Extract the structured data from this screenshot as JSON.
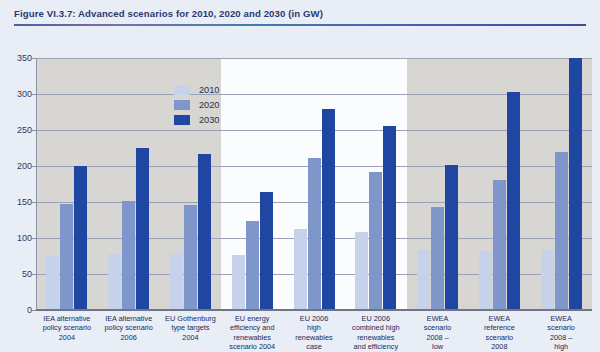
{
  "figure": {
    "title": "Figure VI.3.7: Advanced scenarios for 2010, 2020 and 2030 (in GW)"
  },
  "colors": {
    "s2010": "#c5d2ea",
    "s2020": "#7e96ca",
    "s2030": "#1f46a0",
    "page_background": "#e9edf5",
    "band_grey": "#d8d6d3",
    "band_white": "#fbfcfe",
    "title_text": "#2b3a72"
  },
  "legend": {
    "position": "inside-top-center",
    "entries": [
      {
        "label": "2010",
        "color": "#c5d2ea"
      },
      {
        "label": "2020",
        "color": "#7e96ca"
      },
      {
        "label": "2030",
        "color": "#1f46a0"
      }
    ]
  },
  "yaxis": {
    "ticks": [
      "350",
      "300",
      "250",
      "200",
      "150",
      "100",
      "50",
      "0"
    ],
    "min": 0,
    "max": 350,
    "step": 50
  },
  "chart_data": {
    "type": "bar",
    "title": "Figure VI.3.7: Advanced scenarios for 2010, 2020 and 2030 (in GW)",
    "xlabel": "",
    "ylabel": "",
    "ylim": [
      0,
      350
    ],
    "grid": true,
    "legend_position": "inside-top-center",
    "categories": [
      "IEA alternative policy scenario 2004",
      "IEA alternative policy scenario 2006",
      "EU Gothenburg type targets 2004",
      "EU energy efficiency and renewables scenario 2004",
      "EU 2006 high renewables case",
      "EU 2006 combined high renewables and efficiency",
      "EWEA scenario 2008 – low",
      "EWEA reference scenario 2008",
      "EWEA scenario 2008 – high"
    ],
    "category_lines": [
      [
        "IEA alternative",
        "policy scenario",
        "2004"
      ],
      [
        "IEA alternative",
        "policy scenario",
        "2006"
      ],
      [
        "EU Gothenburg",
        "type targets",
        "2004"
      ],
      [
        "EU energy",
        "efficiency and",
        "renewables",
        "scenario 2004"
      ],
      [
        "EU 2006",
        "high",
        "renewables",
        "case"
      ],
      [
        "EU 2006",
        "combined high",
        "renewables",
        "and efficiency"
      ],
      [
        "EWEA",
        "scenario",
        "2008 –",
        "low"
      ],
      [
        "EWEA",
        "reference",
        "scenario",
        "2008"
      ],
      [
        "EWEA",
        "scenario",
        "2008 –",
        "high"
      ]
    ],
    "series": [
      {
        "name": "2010",
        "color": "#c5d2ea",
        "values": [
          75,
          78,
          79,
          76,
          113,
          108,
          83,
          82,
          84
        ]
      },
      {
        "name": "2020",
        "color": "#7e96ca",
        "values": [
          147,
          151,
          146,
          123,
          211,
          192,
          143,
          180,
          220
        ]
      },
      {
        "name": "2030",
        "color": "#1f46a0",
        "values": [
          200,
          225,
          216,
          164,
          279,
          255,
          202,
          303,
          350
        ]
      }
    ]
  }
}
